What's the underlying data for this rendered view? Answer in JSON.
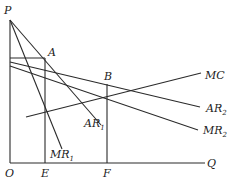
{
  "diagram": {
    "type": "economics-price-discrimination",
    "axes": {
      "origin_label": "O",
      "y_axis_label": "P",
      "x_axis_label": "Q"
    },
    "points": {
      "A": "A",
      "B": "B",
      "E": "E",
      "F": "F"
    },
    "curves": {
      "AR1": {
        "base": "AR",
        "sub": "1"
      },
      "MR1": {
        "base": "MR",
        "sub": "1"
      },
      "AR2": {
        "base": "AR",
        "sub": "2"
      },
      "MR2": {
        "base": "MR",
        "sub": "2"
      },
      "MC": {
        "base": "MC",
        "sub": ""
      }
    },
    "colors": {
      "line": "#2a2a2a",
      "background": "#ffffff"
    }
  }
}
